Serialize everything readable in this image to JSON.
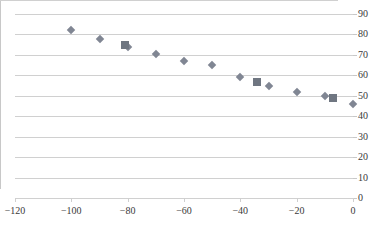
{
  "chart_data": {
    "type": "scatter",
    "title": "",
    "subtitle": "",
    "xlabel": "",
    "ylabel": "",
    "xlim": [
      -120,
      0
    ],
    "ylim": [
      0,
      90
    ],
    "grid": true,
    "grid_axis": "y",
    "y_axis_position": "right",
    "legend": "none",
    "x_ticks": [
      -120,
      -100,
      -80,
      -60,
      -40,
      -20,
      0
    ],
    "y_ticks": [
      0,
      10,
      20,
      30,
      40,
      50,
      60,
      70,
      80,
      90
    ],
    "x_tick_labels": [
      "−120",
      "−100",
      "−80",
      "−60",
      "−40",
      "−20",
      "0"
    ],
    "y_tick_labels": [
      "0",
      "10",
      "20",
      "30",
      "40",
      "50",
      "60",
      "70",
      "80",
      "90"
    ],
    "series": [
      {
        "name": "Series 1",
        "marker": "diamond",
        "color": "#808693",
        "points": [
          {
            "x": -100,
            "y": 82
          },
          {
            "x": -90,
            "y": 78
          },
          {
            "x": -80,
            "y": 74
          },
          {
            "x": -70,
            "y": 70.5
          },
          {
            "x": -60,
            "y": 67
          },
          {
            "x": -50,
            "y": 65
          },
          {
            "x": -40,
            "y": 59
          },
          {
            "x": -30,
            "y": 55
          },
          {
            "x": -20,
            "y": 52
          },
          {
            "x": -10,
            "y": 50
          },
          {
            "x": 0,
            "y": 46
          }
        ]
      },
      {
        "name": "Series 2",
        "marker": "square",
        "color": "#6f7681",
        "points": [
          {
            "x": -81,
            "y": 75
          },
          {
            "x": -34,
            "y": 57
          },
          {
            "x": -7,
            "y": 49
          }
        ]
      }
    ]
  }
}
